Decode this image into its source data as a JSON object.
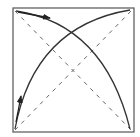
{
  "diagram": {
    "colors": {
      "background": "#ffffff",
      "frame": "#555555",
      "arc": "#333333",
      "dashed": "#666666",
      "arrow": "#222222"
    },
    "frame": {
      "x": 13,
      "y": 8,
      "width": 121,
      "height": 124
    },
    "diagonals": [
      {
        "x1": 15,
        "y1": 11,
        "x2": 131,
        "y2": 130
      },
      {
        "x1": 15,
        "y1": 130,
        "x2": 131,
        "y2": 11
      }
    ],
    "arcs": [
      {
        "path": "M 16 11 Q 104 24 130 129"
      },
      {
        "path": "M 15 129 Q 34 26 130 10"
      }
    ],
    "arrows": [
      {
        "x1": 18,
        "y1": 12,
        "x2": 50,
        "y2": 18,
        "direction": "right"
      },
      {
        "x1": 16,
        "y1": 122,
        "x2": 21,
        "y2": 96,
        "direction": "up"
      }
    ]
  }
}
